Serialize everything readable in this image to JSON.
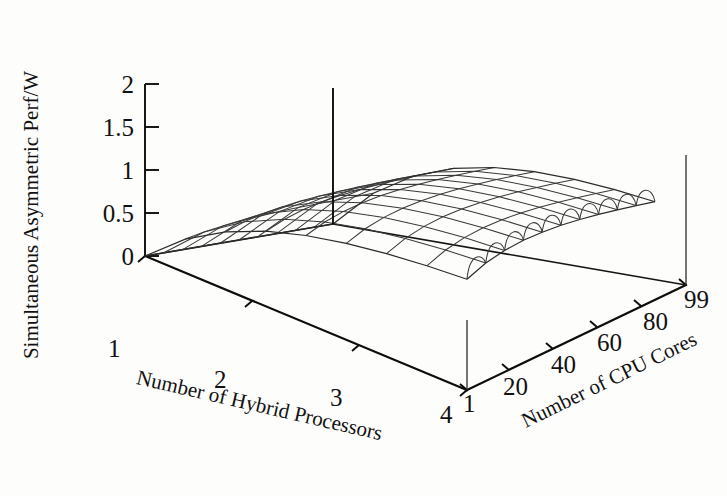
{
  "chart_data": {
    "type": "surface",
    "title": "",
    "zlabel": "Simultaneous Asymmetric Perf/W",
    "ylabel": "Number of Hybrid Processors",
    "xlabel": "Number of CPU Cores",
    "zlim": [
      0,
      2
    ],
    "zticks": [
      "0",
      "0.5",
      "1",
      "1.5",
      "2"
    ],
    "ztick_values": [
      0,
      0.5,
      1,
      1.5,
      2
    ],
    "xticks": [
      "1",
      "20",
      "40",
      "60",
      "80",
      "99"
    ],
    "xtick_values": [
      1,
      20,
      40,
      60,
      80,
      99
    ],
    "yticks": [
      "1",
      "2",
      "3",
      "4"
    ],
    "ytick_values": [
      1,
      2,
      3,
      4
    ],
    "grid": true,
    "legend": "none",
    "x": [
      1,
      20,
      40,
      60,
      80,
      99
    ],
    "y": [
      1,
      2,
      3,
      4
    ],
    "surface_note": "Surface rises steeply from 0 near y=1 to a plateau of about 1.6-1.9 at larger numbers of hybrid processors; ripples along the far edge.",
    "series": [
      {
        "name": "y=1",
        "values": [
          0.05,
          0.12,
          0.16,
          0.19,
          0.21,
          0.22
        ]
      },
      {
        "name": "y=2",
        "values": [
          0.55,
          0.95,
          1.12,
          1.2,
          1.25,
          1.28
        ]
      },
      {
        "name": "y=3",
        "values": [
          1.0,
          1.45,
          1.6,
          1.68,
          1.72,
          1.74
        ]
      },
      {
        "name": "y=4",
        "values": [
          1.35,
          1.72,
          1.83,
          1.88,
          1.9,
          1.92
        ]
      }
    ],
    "geometry": {
      "mesh_columns": 10,
      "mesh_rows": 8,
      "hump_count": 10,
      "origin_px": [
        145,
        256
      ],
      "front_corner_px": [
        467,
        390
      ],
      "back_corner_px": [
        333,
        224
      ],
      "right_corner_px": [
        686,
        285
      ]
    }
  },
  "axes": {
    "z": {
      "title": "Simultaneous Asymmetric Perf/W",
      "ticks": [
        "0",
        "0.5",
        "1",
        "1.5",
        "2"
      ]
    },
    "y": {
      "title": "Number of Hybrid Processors",
      "ticks": [
        "1",
        "2",
        "3",
        "4"
      ]
    },
    "x": {
      "title": "Number of CPU Cores",
      "ticks": [
        "1",
        "20",
        "40",
        "60",
        "80",
        "99"
      ]
    }
  }
}
